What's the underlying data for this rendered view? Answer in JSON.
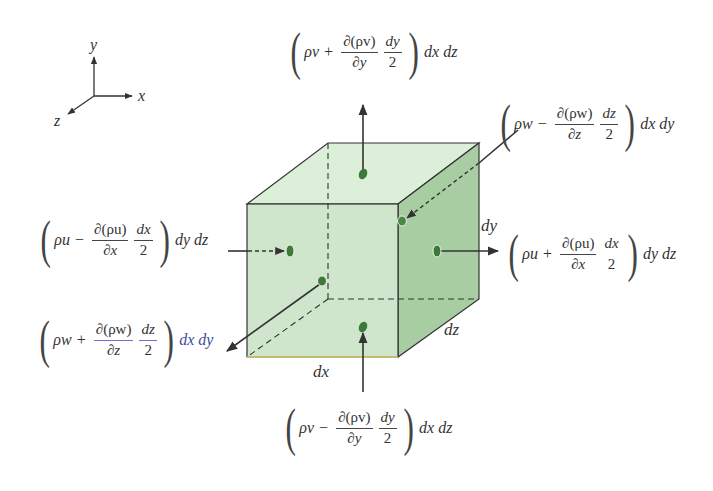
{
  "axes": {
    "x_label": "x",
    "y_label": "y",
    "z_label": "z"
  },
  "cube": {
    "dims": {
      "dx": "dx",
      "dy": "dy",
      "dz": "dz"
    },
    "colors": {
      "front": "#cfe6cc",
      "top": "#dcefd9",
      "side": "#a9cda3",
      "edge": "#333333",
      "dot": "#3d7a3a",
      "arrow": "#333333"
    }
  },
  "fluxes": {
    "top": {
      "term": "ρv",
      "op": "+",
      "deriv_num": "∂(ρv)",
      "deriv_den": "∂y",
      "half_num": "dy",
      "half_den": "2",
      "area": "dx dz",
      "direction": "out"
    },
    "bottom": {
      "term": "ρv",
      "op": "−",
      "deriv_num": "∂(ρv)",
      "deriv_den": "∂y",
      "half_num": "dy",
      "half_den": "2",
      "area": "dx dz",
      "direction": "in"
    },
    "left": {
      "term": "ρu",
      "op": "−",
      "deriv_num": "∂(ρu)",
      "deriv_den": "∂x",
      "half_num": "dx",
      "half_den": "2",
      "area": "dy dz",
      "direction": "in"
    },
    "right": {
      "term": "ρu",
      "op": "+",
      "deriv_num": "∂(ρu)",
      "deriv_den": "∂x",
      "half_num": "dx",
      "half_den": "2",
      "area": "dy dz",
      "direction": "out"
    },
    "back": {
      "term": "ρw",
      "op": "−",
      "deriv_num": "∂(ρw)",
      "deriv_den": "∂z",
      "half_num": "dz",
      "half_den": "2",
      "area": "dx dy",
      "direction": "in"
    },
    "front": {
      "term": "ρw",
      "op": "+",
      "deriv_num": "∂(ρw)",
      "deriv_den": "∂z",
      "half_num": "dz",
      "half_den": "2",
      "area": "dx dy",
      "direction": "out"
    }
  }
}
